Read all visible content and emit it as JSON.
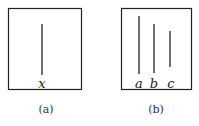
{
  "panels": [
    {
      "caption": "(a)",
      "lines": [
        {
          "label": "x",
          "x": 42,
          "y1": 24,
          "y2": 75
        }
      ]
    },
    {
      "caption": "(b)",
      "lines": [
        {
          "label": "a",
          "x": 139,
          "y1": 16,
          "y2": 74
        },
        {
          "label": "b",
          "x": 154,
          "y1": 24,
          "y2": 73
        },
        {
          "label": "c",
          "x": 170,
          "y1": 31,
          "y2": 67
        }
      ]
    }
  ],
  "colors": {
    "stroke": "#222222"
  }
}
